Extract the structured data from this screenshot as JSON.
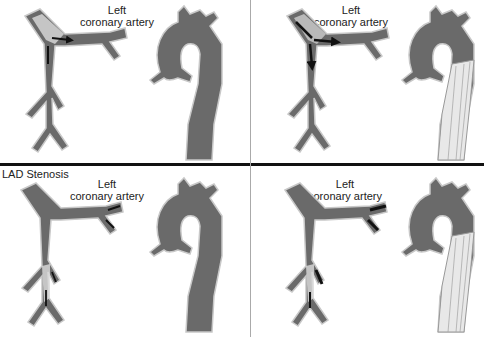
{
  "colors": {
    "vessel_fill": "#6a6a6a",
    "vessel_edge": "#c8c8c8",
    "plaque": "#dcdcdc",
    "arrow": "#111111",
    "catheter": "#e8e8e8",
    "divider": "#111111",
    "vdivider": "#aaaaaa"
  },
  "panels": [
    {
      "id": "top-left",
      "label_line1": "Left",
      "label_line2": "coronary artery"
    },
    {
      "id": "top-right",
      "label_line1": "Left",
      "label_line2": "coronary artery"
    },
    {
      "id": "bottom-left",
      "section_label": "LAD Stenosis",
      "label_line1": "Left",
      "label_line2": "coronary artery"
    },
    {
      "id": "bottom-right",
      "label_line1": "Left",
      "label_line2": "coronary artery"
    }
  ]
}
